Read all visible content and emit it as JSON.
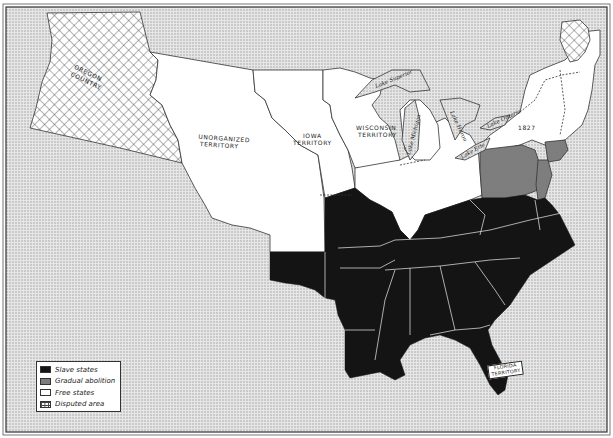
{
  "map": {
    "colors": {
      "slave": "#141414",
      "gradual": "#7d7d7d",
      "free": "#ffffff",
      "background_ocean": "#d9d9d9",
      "border": "#333333"
    },
    "labels": {
      "oregon": "OREGON COUNTRY",
      "oregon_line1": "OREGON",
      "oregon_line2": "COUNTRY",
      "unorganized_line1": "UNORGANIZED",
      "unorganized_line2": "TERRITORY",
      "iowa_line1": "IOWA",
      "iowa_line2": "TERRITORY",
      "wisconsin_line1": "WISCONSIN",
      "wisconsin_line2": "TERRITORY",
      "florida_line1": "FLORIDA",
      "florida_line2": "TERRITORY",
      "year_1827": "1827"
    },
    "lakes": [
      "Lake Superior",
      "Lake Michigan",
      "Lake Huron",
      "Lake Erie",
      "Lake Ontario"
    ]
  },
  "legend": {
    "items": [
      {
        "key": "slave",
        "label": "Slave states"
      },
      {
        "key": "gradual",
        "label": "Gradual abolition"
      },
      {
        "key": "free",
        "label": "Free states"
      },
      {
        "key": "disputed",
        "label": "Disputed area"
      }
    ]
  }
}
